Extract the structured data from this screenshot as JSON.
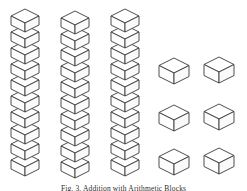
{
  "figure": {
    "caption": "Fig. 3.  Addition with Arithmetic Blocks",
    "caption_top": 184,
    "background_color": "#ffffff",
    "stroke_color": "#3a3a3a",
    "fill_color": "#ffffff",
    "width": 247,
    "height": 191
  },
  "geometry": {
    "cube_half_width": 14,
    "cube_top_half_height": 7,
    "cube_side_height": 9,
    "column_step": 16,
    "single_half_width": 15,
    "single_top_half_height": 7.5,
    "single_side_height": 11
  },
  "columns": [
    {
      "name": "column-1",
      "label": "Ten block column 1",
      "x": 10,
      "y": 8,
      "count": 10
    },
    {
      "name": "column-2",
      "label": "Ten block column 2",
      "x": 60,
      "y": 10,
      "count": 10
    },
    {
      "name": "column-3",
      "label": "Ten block column 3",
      "x": 110,
      "y": 8,
      "count": 10
    }
  ],
  "single_cubes": [
    {
      "name": "unit-cube-1",
      "label": "Unit block 1",
      "x": 158,
      "y": 57
    },
    {
      "name": "unit-cube-2",
      "label": "Unit block 2",
      "x": 203,
      "y": 56
    },
    {
      "name": "unit-cube-3",
      "label": "Unit block 3",
      "x": 158,
      "y": 104
    },
    {
      "name": "unit-cube-4",
      "label": "Unit block 4",
      "x": 203,
      "y": 103
    },
    {
      "name": "unit-cube-5",
      "label": "Unit block 5",
      "x": 158,
      "y": 148
    },
    {
      "name": "unit-cube-6",
      "label": "Unit block 6",
      "x": 203,
      "y": 147
    }
  ]
}
